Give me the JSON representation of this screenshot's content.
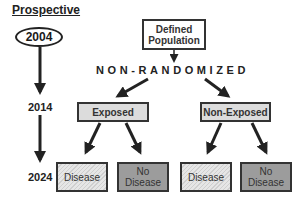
{
  "title": "Prospective",
  "timeline": {
    "start_year": "2004",
    "mid_year": "2014",
    "end_year": "2024"
  },
  "population": {
    "label_line1": "Defined",
    "label_line2": "Population"
  },
  "assignment_label": "NON-RANDOMIZED",
  "groups": [
    {
      "label": "Exposed",
      "outcomes": [
        {
          "line1": "Disease",
          "line2": ""
        },
        {
          "line1": "No",
          "line2": "Disease"
        }
      ]
    },
    {
      "label": "Non-Exposed",
      "outcomes": [
        {
          "line1": "Disease",
          "line2": ""
        },
        {
          "line1": "No",
          "line2": "Disease"
        }
      ]
    }
  ],
  "colors": {
    "line": "#222222",
    "group_fill": "#dcdcdc",
    "disease_fill": "#dadada",
    "no_disease_fill": "#9c9c9c"
  }
}
